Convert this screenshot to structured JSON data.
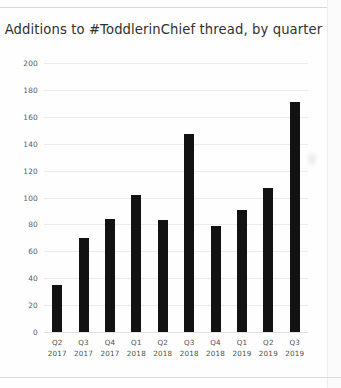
{
  "chart_data": {
    "type": "bar",
    "title": "Additions to #ToddlerinChief thread, by quarter",
    "xlabel": "",
    "ylabel": "",
    "categories": [
      "Q2 2017",
      "Q3 2017",
      "Q4 2017",
      "Q1 2018",
      "Q2 2018",
      "Q3 2018",
      "Q4 2018",
      "Q1 2019",
      "Q2 2019",
      "Q3 2019"
    ],
    "category_lines": [
      [
        "Q2",
        "2017"
      ],
      [
        "Q3",
        "2017"
      ],
      [
        "Q4",
        "2017"
      ],
      [
        "Q1",
        "2018"
      ],
      [
        "Q2",
        "2018"
      ],
      [
        "Q3",
        "2018"
      ],
      [
        "Q4",
        "2018"
      ],
      [
        "Q1",
        "2019"
      ],
      [
        "Q2",
        "2019"
      ],
      [
        "Q3",
        "2019"
      ]
    ],
    "values": [
      35,
      70,
      84,
      102,
      83,
      147,
      79,
      91,
      107,
      171
    ],
    "ylim": [
      0,
      200
    ],
    "ytick_step": 20,
    "yticks": [
      200,
      180,
      160,
      140,
      120,
      100,
      80,
      60,
      40,
      20,
      0
    ],
    "grid": true,
    "legend": false,
    "bar_color": "#121212",
    "grid_color": "#ebebeb",
    "text_color": "#303030"
  }
}
